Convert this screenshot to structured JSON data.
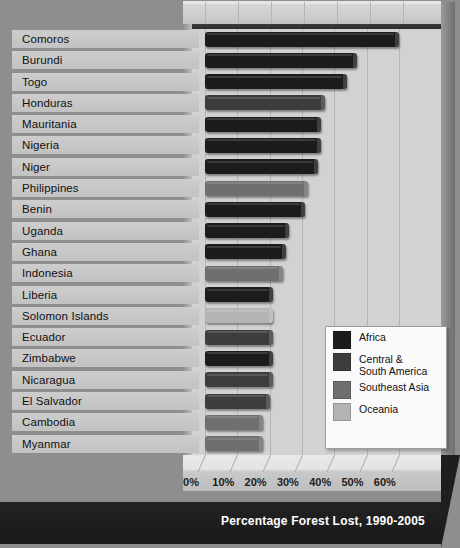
{
  "chart_data": {
    "type": "bar",
    "orientation": "horizontal",
    "title": "Percentage Forest Lost, 1990-2005",
    "xlabel": "Percentage Forest Lost, 1990-2005",
    "ylabel": "",
    "xlim": [
      0,
      65
    ],
    "xticks": [
      "0%",
      "10%",
      "20%",
      "30%",
      "40%",
      "50%",
      "60%"
    ],
    "xtick_values": [
      0,
      10,
      20,
      30,
      40,
      50,
      60
    ],
    "grid": true,
    "legend_position": "inside-right",
    "categories": [
      "Comoros",
      "Burundi",
      "Togo",
      "Honduras",
      "Mauritania",
      "Nigeria",
      "Niger",
      "Philippines",
      "Benin",
      "Uganda",
      "Ghana",
      "Indonesia",
      "Liberia",
      "Solomon Islands",
      "Ecuador",
      "Zimbabwe",
      "Nicaragua",
      "El Salvador",
      "Cambodia",
      "Myanmar"
    ],
    "values": [
      60,
      47,
      44,
      37,
      36,
      36,
      35,
      32,
      31,
      26,
      25,
      24,
      21,
      21,
      21,
      21,
      21,
      20,
      18,
      18
    ],
    "groups": [
      "Africa",
      "Africa",
      "Africa",
      "Central & South America",
      "Africa",
      "Africa",
      "Africa",
      "Southeast Asia",
      "Africa",
      "Africa",
      "Africa",
      "Southeast Asia",
      "Africa",
      "Oceania",
      "Central & South America",
      "Africa",
      "Central & South America",
      "Central & South America",
      "Southeast Asia",
      "Southeast Asia"
    ],
    "series": [
      {
        "name": "Africa",
        "color": "#1c1c1c"
      },
      {
        "name": "Central & South America",
        "color": "#3d3d3d"
      },
      {
        "name": "Southeast Asia",
        "color": "#6f6f6f"
      },
      {
        "name": "Oceania",
        "color": "#b4b4b4"
      }
    ]
  },
  "legend": {
    "items": [
      {
        "label": "Africa",
        "color": "#1c1c1c"
      },
      {
        "label": "Central &\nSouth America",
        "color": "#3d3d3d"
      },
      {
        "label": "Southeast Asia",
        "color": "#6f6f6f"
      },
      {
        "label": "Oceania",
        "color": "#b4b4b4"
      }
    ]
  },
  "footer": {
    "title": "Percentage Forest Lost, 1990-2005"
  }
}
